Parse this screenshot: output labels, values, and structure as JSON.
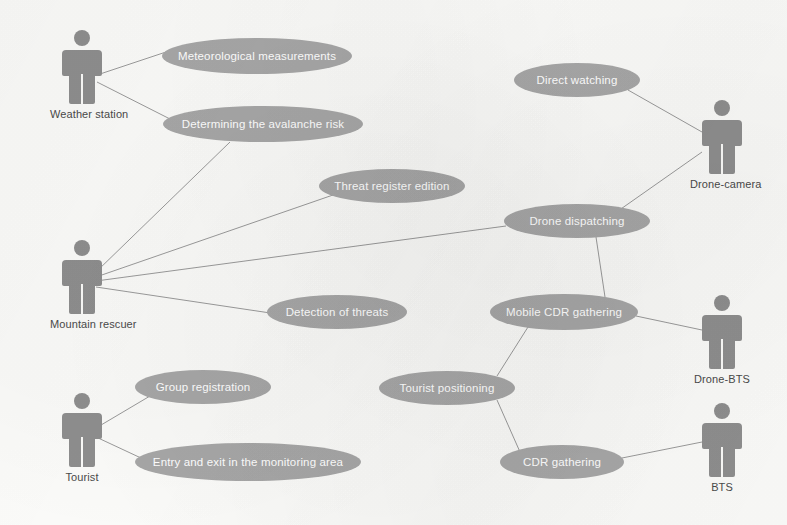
{
  "diagram": {
    "type": "uml-use-case",
    "background_color": "#fbfbf9",
    "actor_color": "#8e8e8e",
    "usecase_fill": "#a7a7a7",
    "usecase_text_color": "#ffffff",
    "link_color": "#9a9a9a",
    "actors": [
      {
        "id": "weather-station",
        "label": "Weather station",
        "x": 50,
        "y": 30
      },
      {
        "id": "mountain-rescuer",
        "label": "Mountain rescuer",
        "x": 50,
        "y": 240
      },
      {
        "id": "tourist",
        "label": "Tourist",
        "x": 50,
        "y": 393
      },
      {
        "id": "drone-camera",
        "label": "Drone-camera",
        "x": 690,
        "y": 100
      },
      {
        "id": "drone-bts",
        "label": "Drone-BTS",
        "x": 690,
        "y": 295
      },
      {
        "id": "bts",
        "label": "BTS",
        "x": 690,
        "y": 403
      }
    ],
    "use_cases": [
      {
        "id": "meteorological-measurements",
        "label": "Meteorological measurements",
        "cx": 257,
        "cy": 56,
        "rx": 95,
        "ry": 18
      },
      {
        "id": "determining-the-avalanche-risk",
        "label": "Determining the avalanche risk",
        "cx": 263,
        "cy": 124,
        "rx": 100,
        "ry": 18
      },
      {
        "id": "direct-watching",
        "label": "Direct watching",
        "cx": 577,
        "cy": 80,
        "rx": 63,
        "ry": 17
      },
      {
        "id": "threat-register-edition",
        "label": "Threat register edition",
        "cx": 392,
        "cy": 186,
        "rx": 73,
        "ry": 17
      },
      {
        "id": "drone-dispatching",
        "label": "Drone dispatching",
        "cx": 577,
        "cy": 221,
        "rx": 73,
        "ry": 17
      },
      {
        "id": "detection-of-threats",
        "label": "Detection of threats",
        "cx": 337,
        "cy": 312,
        "rx": 70,
        "ry": 17
      },
      {
        "id": "mobile-cdr-gathering",
        "label": "Mobile CDR gathering",
        "cx": 564,
        "cy": 312,
        "rx": 74,
        "ry": 18
      },
      {
        "id": "group-registration",
        "label": "Group registration",
        "cx": 203,
        "cy": 387,
        "rx": 68,
        "ry": 17
      },
      {
        "id": "tourist-positioning",
        "label": "Tourist positioning",
        "cx": 447,
        "cy": 388,
        "rx": 68,
        "ry": 17
      },
      {
        "id": "entry-and-exit-in-the-monitoring-area",
        "label": "Entry and exit in the monitoring area",
        "cx": 248,
        "cy": 462,
        "rx": 113,
        "ry": 19
      },
      {
        "id": "cdr-gathering",
        "label": "CDR gathering",
        "cx": 562,
        "cy": 462,
        "rx": 62,
        "ry": 17
      }
    ],
    "links": [
      {
        "from": "weather-station",
        "to": "meteorological-measurements",
        "x1": 97,
        "y1": 75,
        "x2": 166,
        "y2": 52
      },
      {
        "from": "weather-station",
        "to": "determining-the-avalanche-risk",
        "x1": 97,
        "y1": 82,
        "x2": 172,
        "y2": 120
      },
      {
        "from": "mountain-rescuer",
        "to": "determining-the-avalanche-risk",
        "x1": 96,
        "y1": 272,
        "x2": 230,
        "y2": 142
      },
      {
        "from": "mountain-rescuer",
        "to": "threat-register-edition",
        "x1": 96,
        "y1": 277,
        "x2": 333,
        "y2": 195
      },
      {
        "from": "mountain-rescuer",
        "to": "drone-dispatching",
        "x1": 96,
        "y1": 281,
        "x2": 506,
        "y2": 226
      },
      {
        "from": "mountain-rescuer",
        "to": "detection-of-threats",
        "x1": 96,
        "y1": 287,
        "x2": 277,
        "y2": 314
      },
      {
        "from": "direct-watching",
        "to": "drone-camera",
        "x1": 628,
        "y1": 90,
        "x2": 702,
        "y2": 132
      },
      {
        "from": "drone-dispatching",
        "to": "drone-camera",
        "x1": 618,
        "y1": 211,
        "x2": 702,
        "y2": 152
      },
      {
        "from": "drone-dispatching",
        "to": "mobile-cdr-gathering",
        "x1": 596,
        "y1": 237,
        "x2": 605,
        "y2": 297
      },
      {
        "from": "mobile-cdr-gathering",
        "to": "drone-bts",
        "x1": 636,
        "y1": 316,
        "x2": 702,
        "y2": 330
      },
      {
        "from": "tourist-positioning",
        "to": "mobile-cdr-gathering",
        "x1": 497,
        "y1": 376,
        "x2": 528,
        "y2": 327
      },
      {
        "from": "tourist-positioning",
        "to": "cdr-gathering",
        "x1": 497,
        "y1": 400,
        "x2": 520,
        "y2": 452
      },
      {
        "from": "cdr-gathering",
        "to": "bts",
        "x1": 622,
        "y1": 458,
        "x2": 702,
        "y2": 442
      },
      {
        "from": "tourist",
        "to": "group-registration",
        "x1": 96,
        "y1": 428,
        "x2": 150,
        "y2": 396
      },
      {
        "from": "tourist",
        "to": "entry-and-exit-in-the-monitoring-area",
        "x1": 96,
        "y1": 437,
        "x2": 141,
        "y2": 458
      }
    ]
  }
}
